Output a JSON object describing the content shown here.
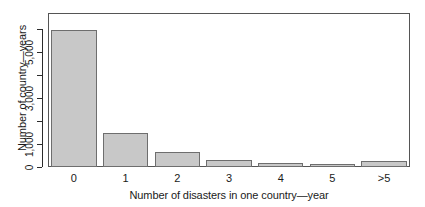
{
  "chart_data": {
    "type": "bar",
    "title": "",
    "subtitle": "",
    "xlabel": "Number of disasters in one country—year",
    "ylabel": "Number of country—years",
    "categories": [
      "0",
      "1",
      "2",
      "3",
      "4",
      "5",
      ">5"
    ],
    "values": [
      5950,
      1500,
      650,
      300,
      175,
      130,
      260
    ],
    "series": [
      {
        "name": "country-years",
        "values": [
          5950,
          1500,
          650,
          300,
          175,
          130,
          260
        ]
      }
    ],
    "ylim": [
      0,
      6700
    ],
    "xlim": [
      0,
      7
    ],
    "y_tick_values": [
      0,
      1000,
      2000,
      3000,
      4000,
      5000,
      6000
    ],
    "y_tick_labels": [
      "0",
      "1,000",
      "",
      "3,000",
      "",
      "5,000",
      ""
    ],
    "y_labeled_ticks": [
      {
        "value": 0,
        "label": "0"
      },
      {
        "value": 1000,
        "label": "1,000"
      },
      {
        "value": 3000,
        "label": "3,000"
      },
      {
        "value": 5000,
        "label": "5,000"
      }
    ],
    "x_tick_labels": [
      "0",
      "1",
      "2",
      "3",
      "4",
      "5",
      ">5"
    ],
    "grid": false,
    "legend": false,
    "legend_position": "none",
    "bar_fill_color": "#c8c8c8",
    "bar_edge_color": "#6e6e6e",
    "axis_color": "#2b2b2b",
    "frame_color": "#555555",
    "background_color": "#ffffff",
    "annotations": []
  },
  "figure": {
    "axis_title_y": "Number of country—years",
    "axis_title_x": "Number of disasters in one country—year"
  }
}
